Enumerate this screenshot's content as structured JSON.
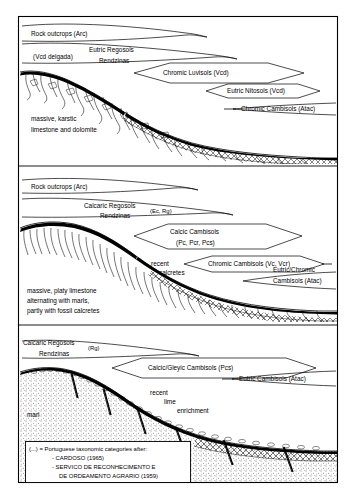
{
  "figure": {
    "width": 356,
    "height": 498,
    "background_color": "#ffffff",
    "line_color": "#000000"
  },
  "panels": [
    {
      "id": "panel-top",
      "substrate_label_lines": [
        "massive, karstic",
        "limestone and dolomite"
      ],
      "soil_labels": [
        {
          "name": "rock-outcrops",
          "text": "Rock outcrops (Arc)"
        },
        {
          "name": "vcd-delgada",
          "text": "(Vcd delgada)"
        },
        {
          "name": "eutric-regosols",
          "text": "Eutric Regosols"
        },
        {
          "name": "rendzinas",
          "text": "Rendzinas"
        },
        {
          "name": "chromic-luvisols",
          "text": "Chromic Luvisols (Vcd)"
        },
        {
          "name": "eutric-nitosols",
          "text": "Eutric Nitosols (Vcd)"
        },
        {
          "name": "chromic-cambisols",
          "text": "Chromic Cambisols (Atac)"
        }
      ]
    },
    {
      "id": "panel-middle",
      "substrate_label_lines": [
        "massive, platy limestone",
        "alternating with marls,",
        "partly with fossil calcretes"
      ],
      "extra_labels": [
        {
          "name": "recent-calcretes-line1",
          "text": "recent"
        },
        {
          "name": "recent-calcretes-line2",
          "text": "calcretes"
        }
      ],
      "soil_labels": [
        {
          "name": "rock-outcrops",
          "text": "Rock outcrops (Arc)"
        },
        {
          "name": "calcaric-regosols",
          "text": "Calcaric Regosols"
        },
        {
          "name": "calcaric-regosols-code",
          "text": "(Ec, Rg)"
        },
        {
          "name": "rendzinas",
          "text": "Rendzinas"
        },
        {
          "name": "calcic-cambisols",
          "text": "Calcic Cambisols"
        },
        {
          "name": "calcic-cambisols-code",
          "text": "(Pc, Pcr, Pcs)"
        },
        {
          "name": "chromic-cambisols",
          "text": "Chromic Cambisols (Vc, Vcr)"
        },
        {
          "name": "eutric-chromic-cambisols-line1",
          "text": "Eutric/Chromic"
        },
        {
          "name": "eutric-chromic-cambisols-line2",
          "text": "Cambisols (Atac)"
        }
      ]
    },
    {
      "id": "panel-bottom",
      "substrate_label_lines": [
        "marl"
      ],
      "extra_labels": [
        {
          "name": "recent-lime-enrichment-line1",
          "text": "recent"
        },
        {
          "name": "recent-lime-enrichment-line2",
          "text": "lime"
        },
        {
          "name": "recent-lime-enrichment-line3",
          "text": "enrichment"
        }
      ],
      "soil_labels": [
        {
          "name": "calcaric-regosols",
          "text": "Calcaric Regosols"
        },
        {
          "name": "calcaric-regosols-code",
          "text": "(Rg)"
        },
        {
          "name": "rendzinas",
          "text": "Rendzinas"
        },
        {
          "name": "calcic-gleyic-cambisols",
          "text": "Calcic/Gleyic Cambisols (Pcs)"
        },
        {
          "name": "eutric-cambisols",
          "text": "Eutric Cambisols (Atac)"
        }
      ]
    }
  ],
  "legend": {
    "line1": "(...) = Portuguese taxonomic categories after:",
    "line2": "- CARDOSO (1965)",
    "line3": "- SERVICO  DE RECONHECIMENTO E",
    "line4": "DE ORDEAMENTO AGRARIO (1959)"
  }
}
